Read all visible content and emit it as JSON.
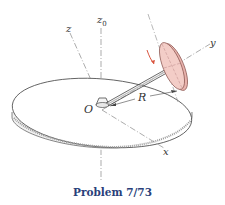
{
  "figure": {
    "caption": "Problem 7/73",
    "labels": {
      "z0": "z",
      "z0_sub": "0",
      "z": "z",
      "y": "y",
      "x": "x",
      "O": "O",
      "R": "R"
    },
    "colors": {
      "disc_fill": "#f3cdc7",
      "disc_rim": "#d79a94",
      "arrow": "#d9553f",
      "caption": "#2a3f7a",
      "line": "#444444",
      "axis": "#777777"
    }
  }
}
